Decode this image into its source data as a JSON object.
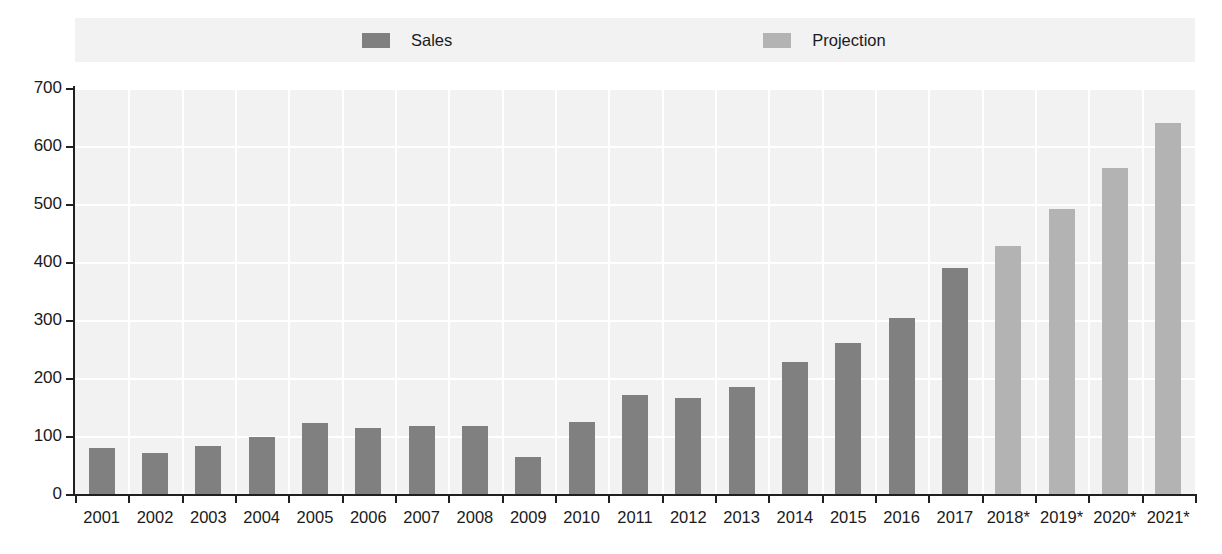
{
  "legend": {
    "items": [
      {
        "label": "Sales",
        "color": "#808080",
        "icon": "legend-swatch-icon"
      },
      {
        "label": "Projection",
        "color": "#b3b3b3",
        "icon": "legend-swatch-icon"
      }
    ]
  },
  "axis": {
    "y_ticks": [
      "700",
      "600",
      "500",
      "400",
      "300",
      "200",
      "100",
      "0"
    ],
    "y_min": 0,
    "y_max": 700,
    "y_step": 100
  },
  "colors": {
    "sales": "#808080",
    "projection": "#b3b3b3",
    "plot_background": "#f2f2f2",
    "gridline": "#ffffff",
    "axis": "#231f20",
    "text": "#1a1a1a",
    "page_background": "#ffffff"
  },
  "chart_data": {
    "type": "bar",
    "title": "",
    "subtitle": "",
    "xlabel": "",
    "ylabel": "",
    "ylim": [
      0,
      700
    ],
    "yticks": [
      0,
      100,
      200,
      300,
      400,
      500,
      600,
      700
    ],
    "grid": true,
    "legend_position": "top",
    "categories": [
      "2001",
      "2002",
      "2003",
      "2004",
      "2005",
      "2006",
      "2007",
      "2008",
      "2009",
      "2010",
      "2011",
      "2012",
      "2013",
      "2014",
      "2015",
      "2016",
      "2017",
      "2018*",
      "2019*",
      "2020*",
      "2021*"
    ],
    "series": [
      {
        "name": "Sales",
        "color": "#808080",
        "values": [
          80,
          70,
          83,
          99,
          122,
          113,
          117,
          117,
          64,
          125,
          170,
          165,
          185,
          227,
          260,
          303,
          390,
          null,
          null,
          null,
          null
        ]
      },
      {
        "name": "Projection",
        "color": "#b3b3b3",
        "values": [
          null,
          null,
          null,
          null,
          null,
          null,
          null,
          null,
          null,
          null,
          null,
          null,
          null,
          null,
          null,
          null,
          null,
          428,
          492,
          562,
          640
        ]
      }
    ],
    "bars": [
      {
        "category": "2001",
        "value": 80,
        "series": "Sales"
      },
      {
        "category": "2002",
        "value": 70,
        "series": "Sales"
      },
      {
        "category": "2003",
        "value": 83,
        "series": "Sales"
      },
      {
        "category": "2004",
        "value": 99,
        "series": "Sales"
      },
      {
        "category": "2005",
        "value": 122,
        "series": "Sales"
      },
      {
        "category": "2006",
        "value": 113,
        "series": "Sales"
      },
      {
        "category": "2007",
        "value": 117,
        "series": "Sales"
      },
      {
        "category": "2008",
        "value": 117,
        "series": "Sales"
      },
      {
        "category": "2009",
        "value": 64,
        "series": "Sales"
      },
      {
        "category": "2010",
        "value": 125,
        "series": "Sales"
      },
      {
        "category": "2011",
        "value": 170,
        "series": "Sales"
      },
      {
        "category": "2012",
        "value": 165,
        "series": "Sales"
      },
      {
        "category": "2013",
        "value": 185,
        "series": "Sales"
      },
      {
        "category": "2014",
        "value": 227,
        "series": "Sales"
      },
      {
        "category": "2015",
        "value": 260,
        "series": "Sales"
      },
      {
        "category": "2016",
        "value": 303,
        "series": "Sales"
      },
      {
        "category": "2017",
        "value": 390,
        "series": "Sales"
      },
      {
        "category": "2018*",
        "value": 428,
        "series": "Projection"
      },
      {
        "category": "2019*",
        "value": 492,
        "series": "Projection"
      },
      {
        "category": "2020*",
        "value": 562,
        "series": "Projection"
      },
      {
        "category": "2021*",
        "value": 640,
        "series": "Projection"
      }
    ]
  }
}
